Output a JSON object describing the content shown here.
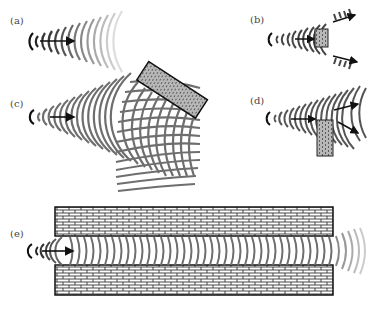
{
  "figure": {
    "panels": [
      {
        "id": "a",
        "label": "(a)",
        "description": "Sound waves spreading from a source"
      },
      {
        "id": "b",
        "label": "(b)",
        "description": "Small obstacle splits sound waves"
      },
      {
        "id": "c",
        "label": "(c)",
        "description": "Sound reflected by an angled wall"
      },
      {
        "id": "d",
        "label": "(d)",
        "description": "Sound diffracted around a partial wall"
      },
      {
        "id": "e",
        "label": "(e)",
        "description": "Sound channelled between two walls"
      }
    ],
    "colors": {
      "wave": "#6e6e6e",
      "wave_faded": "#cfcfcf",
      "arrow": "#111111",
      "brick_fill": "#ffffff",
      "brick_line": "#333333",
      "label": "#444444"
    }
  }
}
